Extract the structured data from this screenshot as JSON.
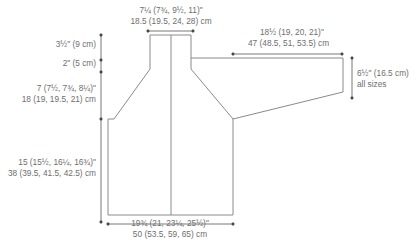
{
  "diagram": {
    "type": "garment-schematic",
    "colors": {
      "outline": "#8a8a8a",
      "dimension_line": "#555555",
      "text": "#6e6e6e"
    },
    "labels": {
      "neck_width": {
        "imperial": "7¼ (7¾, 9½, 11)\"",
        "metric": "18.5 (19.5, 24, 28) cm"
      },
      "sleeve_length": {
        "imperial": "18½ (19, 20, 21)\"",
        "metric": "47 (48.5, 51, 53.5) cm"
      },
      "neck_depth_top": {
        "imperial": "3½\" (9 cm)"
      },
      "neck_depth_bottom": {
        "imperial": "2\" (5 cm)"
      },
      "yoke_depth": {
        "imperial": "7 (7½, 7¾, 8¼)\"",
        "metric": "18 (19, 19.5, 21) cm"
      },
      "sleeve_width": {
        "imperial": "6½\" (16.5 cm)",
        "note": "all sizes"
      },
      "body_length": {
        "imperial": "15 (15½, 16¼, 16¾)\"",
        "metric": "38 (39.5, 41.5, 42.5) cm"
      },
      "body_width": {
        "imperial": "19¾ (21, 23¼, 25½)\"",
        "metric": "50 (53.5, 59, 65) cm"
      }
    }
  }
}
